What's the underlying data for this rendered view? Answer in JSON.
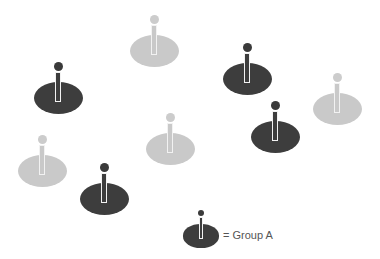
{
  "colors": {
    "dark": "#3d3d3d",
    "light": "#c9c9c9",
    "dark_head": "#3a3a3a",
    "light_head": "#cccccc"
  },
  "pins": [
    {
      "group": "A",
      "shade": "dark",
      "x": 58,
      "y": 98
    },
    {
      "group": "other",
      "shade": "light",
      "x": 154,
      "y": 51
    },
    {
      "group": "A",
      "shade": "dark",
      "x": 247,
      "y": 79
    },
    {
      "group": "other",
      "shade": "light",
      "x": 337,
      "y": 109
    },
    {
      "group": "A",
      "shade": "dark",
      "x": 275,
      "y": 137
    },
    {
      "group": "other",
      "shade": "light",
      "x": 170,
      "y": 149
    },
    {
      "group": "other",
      "shade": "light",
      "x": 42,
      "y": 171
    },
    {
      "group": "A",
      "shade": "dark",
      "x": 104,
      "y": 199
    }
  ],
  "legend": {
    "pin": {
      "shade": "dark",
      "x": 201,
      "y": 236
    },
    "label": "= Group A"
  }
}
